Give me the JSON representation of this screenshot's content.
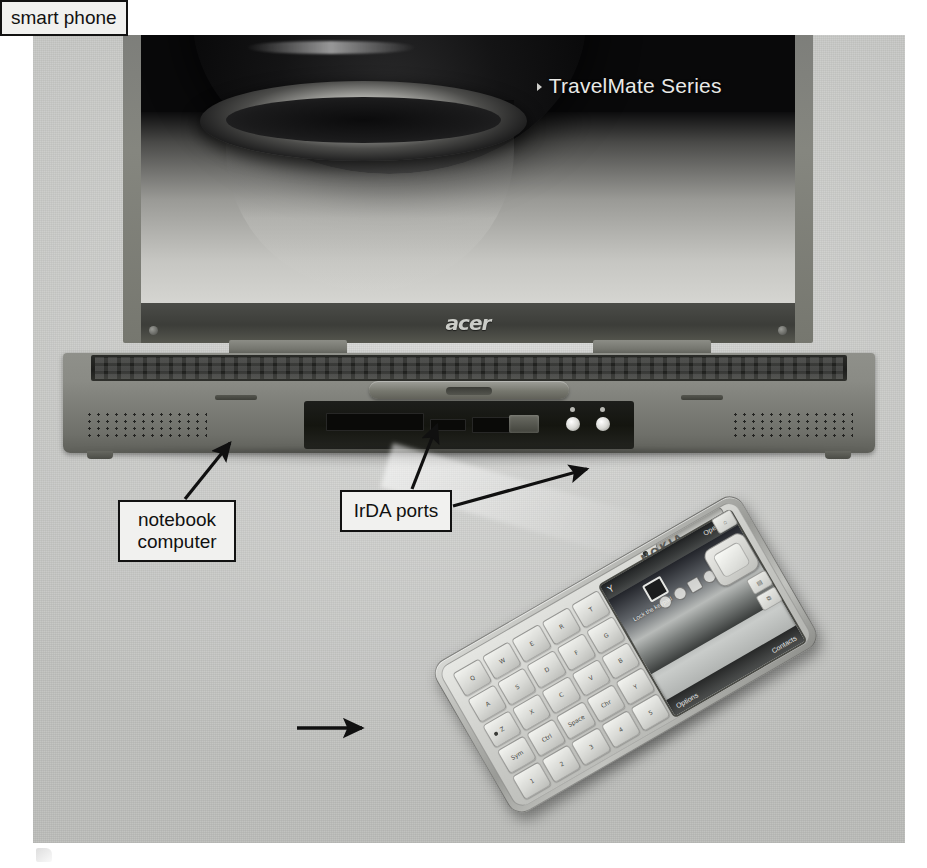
{
  "figure": {
    "kind": "photograph",
    "background_color": "#c6c7c4",
    "page_background": "#ffffff"
  },
  "laptop": {
    "brand": "acer",
    "screen": {
      "title": "TravelMate Series",
      "bullet_glyph": "triangle-right",
      "wallpaper": "dark abstract lens / water-drop image"
    },
    "front_ports": {
      "irda_label": "IrDA port",
      "indicator_count": 2
    }
  },
  "phone": {
    "brand": "NOKIA",
    "form_factor": "QWERTY candybar smart phone",
    "screen": {
      "signal_glyph": "Y",
      "carrier": "Operator",
      "shortcut_note": "Lock the keypad",
      "softkey_left": "Options",
      "softkey_right": "Contacts"
    },
    "keys": [
      "Q",
      "W",
      "E",
      "R",
      "T",
      "A",
      "S",
      "D",
      "F",
      "G",
      "Z",
      "X",
      "C",
      "V",
      "B",
      "Sym",
      "Ctrl",
      "Space",
      "Chr",
      "Y",
      "1",
      "2",
      "3",
      "4",
      "5"
    ],
    "side_keys": [
      "⌂",
      "▤",
      "⧉"
    ]
  },
  "callouts": [
    {
      "id": "notebook",
      "text": "notebook\ncomputer",
      "target": "laptop front-left corner"
    },
    {
      "id": "irda",
      "text": "IrDA ports",
      "target": "laptop IrDA port and phone IrDA port"
    },
    {
      "id": "smartphone",
      "text": "smart phone",
      "target": "smart phone body"
    }
  ],
  "colors": {
    "callout_fill": "#f1f1ef",
    "callout_border": "#121212",
    "text": "#111111",
    "photo_backdrop": "#c6c7c4",
    "screen_text": "#e9e9e6"
  }
}
